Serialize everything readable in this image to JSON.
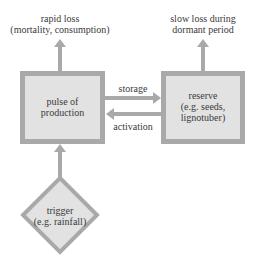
{
  "colors": {
    "border": "#a9a9a9",
    "fill": "#e2e2e2",
    "arrow": "#a9a9a9",
    "text": "#3a3a3a"
  },
  "diagram": {
    "outputs": {
      "rapid_loss": {
        "line1": "rapid loss",
        "line2": "(mortality, consumption)"
      },
      "slow_loss": {
        "line1": "slow loss during",
        "line2": "dormant period"
      }
    },
    "nodes": {
      "pulse": {
        "line1": "pulse of",
        "line2": "production",
        "shape": "rectangle"
      },
      "reserve": {
        "line1": "reserve",
        "line2": "(e.g. seeds,",
        "line3": "lignotuber)",
        "shape": "rectangle"
      },
      "trigger": {
        "line1": "trigger",
        "line2": "(e.g. rainfall)",
        "shape": "diamond"
      }
    },
    "edges": {
      "storage": {
        "label": "storage",
        "from": "pulse",
        "to": "reserve"
      },
      "activation": {
        "label": "activation",
        "from": "reserve",
        "to": "pulse"
      },
      "trigger_to_pulse": {
        "from": "trigger",
        "to": "pulse"
      },
      "pulse_to_rapid_loss": {
        "from": "pulse",
        "to": "rapid loss"
      },
      "reserve_to_slow_loss": {
        "from": "reserve",
        "to": "slow loss"
      }
    }
  }
}
